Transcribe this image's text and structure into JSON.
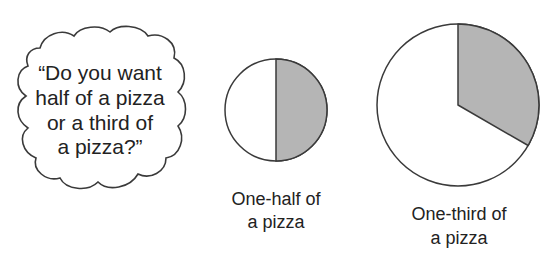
{
  "speech_bubble": {
    "lines": [
      "“Do you want",
      "half of a pizza",
      "or a third of",
      "a pizza?”"
    ]
  },
  "pizzas": [
    {
      "fraction": "1/2",
      "label_lines": [
        "One-half of",
        "a pizza"
      ],
      "shaded_fraction": 0.5
    },
    {
      "fraction": "1/3",
      "label_lines": [
        "One-third of",
        "a pizza"
      ],
      "shaded_fraction": 0.3333
    }
  ],
  "colors": {
    "outline": "#3a3a3a",
    "shaded": "#b5b5b5",
    "unshaded": "#ffffff"
  }
}
